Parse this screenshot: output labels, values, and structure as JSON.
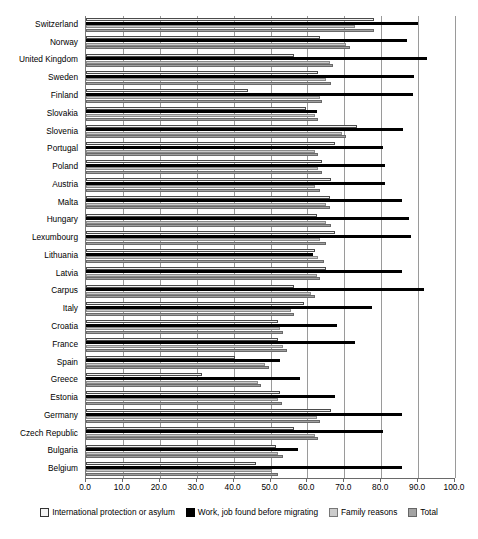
{
  "chart_data": {
    "type": "bar",
    "orientation": "horizontal",
    "title": "",
    "xlabel": "",
    "ylabel": "",
    "xlim": [
      0.0,
      100.0
    ],
    "xticks": [
      "0.0",
      "10.0",
      "20.0",
      "30.0",
      "40.0",
      "50.0",
      "60.0",
      "70.0",
      "80.0",
      "90.0",
      "100.0"
    ],
    "grid": true,
    "legend_position": "bottom",
    "categories": [
      "Switzerland",
      "Norway",
      "United Kingdom",
      "Sweden",
      "Finland",
      "Slovakia",
      "Slovenia",
      "Portugal",
      "Poland",
      "Austria",
      "Malta",
      "Hungary",
      "Lexumbourg",
      "Lithuania",
      "Latvia",
      "Carpus",
      "Italy",
      "Croatia",
      "France",
      "Spain",
      "Greece",
      "Estonia",
      "Germany",
      "Czech Republic",
      "Bulgaria",
      "Belgium"
    ],
    "series": [
      {
        "name": "International protection or asylum",
        "color": "#f2f2f2",
        "values": [
          78.0,
          63.5,
          56.5,
          63.0,
          44.0,
          59.5,
          73.5,
          67.5,
          64.0,
          66.5,
          66.0,
          62.5,
          67.5,
          62.0,
          65.0,
          56.5,
          59.0,
          52.0,
          52.0,
          40.5,
          31.5,
          52.5,
          66.5,
          56.5,
          51.5,
          46.0
        ]
      },
      {
        "name": "Work, job found before migrating",
        "color": "#000000",
        "values": [
          90.0,
          87.0,
          92.5,
          89.0,
          88.5,
          62.5,
          86.0,
          80.5,
          81.0,
          81.0,
          85.5,
          87.5,
          88.0,
          61.5,
          85.5,
          91.5,
          77.5,
          68.0,
          73.0,
          52.5,
          58.0,
          67.5,
          85.5,
          80.5,
          57.5,
          85.5
        ]
      },
      {
        "name": "Family reasons",
        "color": "#c9c9c9",
        "values": [
          73.0,
          70.5,
          66.0,
          65.0,
          63.5,
          62.0,
          69.5,
          62.0,
          63.0,
          62.0,
          65.0,
          65.0,
          63.5,
          63.0,
          62.5,
          61.0,
          55.5,
          52.5,
          53.5,
          48.5,
          46.5,
          52.0,
          62.5,
          62.0,
          52.0,
          50.5
        ]
      },
      {
        "name": "Total",
        "color": "#a0a0a0",
        "values": [
          78.0,
          71.5,
          67.0,
          66.5,
          64.0,
          63.0,
          70.5,
          63.0,
          64.0,
          63.5,
          66.0,
          66.5,
          65.0,
          64.5,
          63.5,
          62.0,
          56.5,
          53.5,
          54.5,
          49.5,
          47.5,
          53.0,
          63.5,
          63.0,
          53.5,
          52.0
        ]
      }
    ]
  },
  "legend": {
    "items": [
      {
        "label": "International protection or asylum",
        "swatch": "swatch-international-protection"
      },
      {
        "label": "Work, job found before migrating",
        "swatch": "swatch-work"
      },
      {
        "label": "Family reasons",
        "swatch": "swatch-family"
      },
      {
        "label": "Total",
        "swatch": "swatch-total"
      }
    ]
  },
  "caption": ""
}
